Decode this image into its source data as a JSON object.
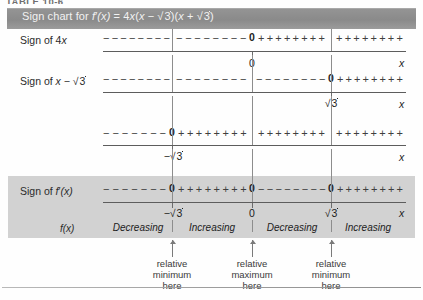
{
  "table_caption": "TABLE 10-6",
  "header": {
    "prefix": "Sign chart for ",
    "fname": "f",
    "prime": "′",
    "arg": "(x)",
    "eq": " = 4",
    "x1": "x",
    "open": "(",
    "x2": "x",
    "minus": " − ",
    "r1": "3",
    "close1": ")(",
    "x3": "x",
    "plus": " + ",
    "r2": "3",
    "close2": ")",
    "full_text": "Sign chart for f'(x) = 4x(x − √3)(x + √3)"
  },
  "axis": {
    "x_label": "x",
    "ticks": [
      {
        "id": "neg-sqrt3",
        "label": "−√3",
        "left": 172
      },
      {
        "id": "zero",
        "label": "0",
        "left": 252
      },
      {
        "id": "sqrt3",
        "label": "√3",
        "left": 331
      }
    ]
  },
  "rows": [
    {
      "id": "sign-of-4x",
      "label_text": "Sign of 4x",
      "label_plain": "Sign of 4x",
      "factor": "4x",
      "zero_at": "0",
      "zero_left": 252,
      "axis_tick_label": "0",
      "intervals": [
        {
          "sign": "-",
          "from": 103,
          "to": 172
        },
        {
          "sign": "-",
          "from": 176,
          "to": 249
        },
        {
          "sign": "+",
          "from": 258,
          "to": 327
        },
        {
          "sign": "+",
          "from": 336,
          "to": 405
        }
      ]
    },
    {
      "id": "sign-of-x-minus-sqrt3",
      "label_text": "Sign of x − √3",
      "label_plain": "Sign of x - sqrt(3)",
      "factor": "x − √3",
      "zero_at": "0",
      "zero_left": 331,
      "axis_tick_label": "√3",
      "intervals": [
        {
          "sign": "-",
          "from": 103,
          "to": 172
        },
        {
          "sign": "-",
          "from": 176,
          "to": 249
        },
        {
          "sign": "-",
          "from": 256,
          "to": 328
        },
        {
          "sign": "+",
          "from": 337,
          "to": 405
        }
      ]
    },
    {
      "id": "sign-of-x-plus-sqrt3",
      "label_text": "",
      "label_plain": "",
      "factor": "x + √3",
      "zero_at": "0",
      "zero_left": 172,
      "axis_tick_label": "−√3",
      "intervals": [
        {
          "sign": "-",
          "from": 103,
          "to": 169
        },
        {
          "sign": "+",
          "from": 178,
          "to": 249
        },
        {
          "sign": "+",
          "from": 258,
          "to": 327
        },
        {
          "sign": "+",
          "from": 336,
          "to": 405
        }
      ]
    }
  ],
  "summary": {
    "id": "sign-of-f-prime",
    "label_prefix": "Sign of ",
    "label_f": "f",
    "label_prime": "′",
    "label_arg": "(x)",
    "label_plain": "Sign of f'(x)",
    "zeros": [
      {
        "label": "0",
        "left": 172
      },
      {
        "label": "0",
        "left": 252
      },
      {
        "label": "0",
        "left": 331
      }
    ],
    "intervals": [
      {
        "sign": "-",
        "from": 103,
        "to": 169
      },
      {
        "sign": "+",
        "from": 178,
        "to": 249
      },
      {
        "sign": "-",
        "from": 258,
        "to": 328
      },
      {
        "sign": "+",
        "from": 337,
        "to": 405
      }
    ]
  },
  "behavior": {
    "label_f": "f",
    "label_arg": "(x)",
    "label_plain": "f(x)",
    "segments": [
      {
        "text": "Decreasing",
        "center": 138
      },
      {
        "text": "Increasing",
        "center": 212
      },
      {
        "text": "Decreasing",
        "center": 292
      },
      {
        "text": "Increasing",
        "center": 368
      }
    ]
  },
  "annotations": [
    {
      "id": "annot-rel-min-1",
      "line1": "relative",
      "line2": "minimum",
      "line3": "here",
      "center": 172
    },
    {
      "id": "annot-rel-max",
      "line1": "relative",
      "line2": "maximum",
      "line3": "here",
      "center": 252
    },
    {
      "id": "annot-rel-min-2",
      "line1": "relative",
      "line2": "minimum",
      "line3": "here",
      "center": 331
    }
  ],
  "colors": {
    "header_bar": "#8f8f8f",
    "header_text": "#f2f2f2",
    "highlight_band": "#d2d2d2",
    "axis_line": "#5d5d5d",
    "text": "#2b2b2b"
  }
}
